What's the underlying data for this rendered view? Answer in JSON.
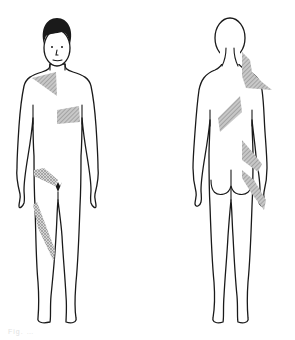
{
  "diagram": {
    "type": "body-map",
    "views": [
      {
        "id": "front",
        "label": "anterior view",
        "shaded_regions": [
          "right upper chest / shoulder (triangular)",
          "left lower chest (rectangular)",
          "right groin / inguinal band",
          "right anterior thigh (oblique band)"
        ]
      },
      {
        "id": "back",
        "label": "posterior view",
        "shaded_regions": [
          "left neck / upper shoulder",
          "right mid back (oblique band)",
          "left lower back (oblique band)",
          "left buttock / flank (oblique band)"
        ]
      }
    ],
    "colors": {
      "outline": "#1a1a1a",
      "shading": "#9a9a9a",
      "background": "#ffffff"
    },
    "caption": "Fig. …"
  }
}
